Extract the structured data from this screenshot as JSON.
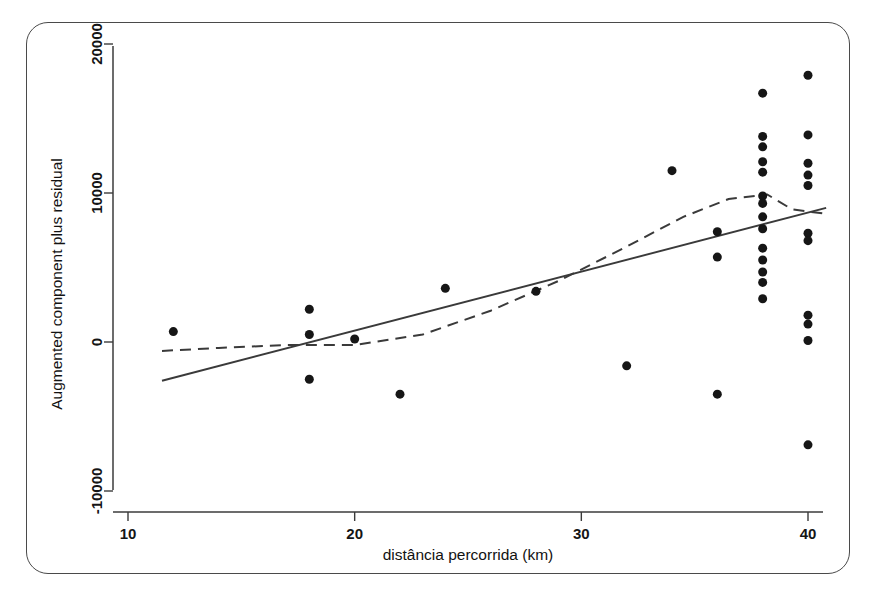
{
  "figure": {
    "frame_visible": true,
    "background_color": "#ffffff",
    "ink_color": "#161616"
  },
  "chart_data": {
    "type": "scatter",
    "title": "",
    "subtitle": "",
    "xlabel": "distância percorrida (km)",
    "ylabel": "Augmented component plus residual",
    "xlim": [
      10,
      41
    ],
    "ylim": [
      -11500,
      21000
    ],
    "xticks": [
      10,
      20,
      30,
      40
    ],
    "xtick_labels": [
      "10",
      "20",
      "30",
      "40"
    ],
    "yticks": [
      -10000,
      0,
      10000,
      20000
    ],
    "ytick_labels": [
      "-10000",
      "0",
      "10000",
      "20000"
    ],
    "grid": false,
    "legend": null,
    "legend_position": "none",
    "marker": {
      "shape": "circle",
      "color": "#161616",
      "size_px": 9
    },
    "points": [
      {
        "x": 12,
        "y": 700
      },
      {
        "x": 18,
        "y": 2200
      },
      {
        "x": 18,
        "y": 500
      },
      {
        "x": 18,
        "y": -2500
      },
      {
        "x": 20,
        "y": 200
      },
      {
        "x": 22,
        "y": -3500
      },
      {
        "x": 24,
        "y": 3600
      },
      {
        "x": 28,
        "y": 3400
      },
      {
        "x": 32,
        "y": -1600
      },
      {
        "x": 34,
        "y": 11500
      },
      {
        "x": 36,
        "y": 7400
      },
      {
        "x": 36,
        "y": 5700
      },
      {
        "x": 36,
        "y": -3500
      },
      {
        "x": 38,
        "y": 16700
      },
      {
        "x": 38,
        "y": 13800
      },
      {
        "x": 38,
        "y": 13100
      },
      {
        "x": 38,
        "y": 12100
      },
      {
        "x": 38,
        "y": 11400
      },
      {
        "x": 38,
        "y": 9800
      },
      {
        "x": 38,
        "y": 9300
      },
      {
        "x": 38,
        "y": 8400
      },
      {
        "x": 38,
        "y": 7600
      },
      {
        "x": 38,
        "y": 6300
      },
      {
        "x": 38,
        "y": 5500
      },
      {
        "x": 38,
        "y": 4700
      },
      {
        "x": 38,
        "y": 4000
      },
      {
        "x": 38,
        "y": 2900
      },
      {
        "x": 40,
        "y": 17900
      },
      {
        "x": 40,
        "y": 13900
      },
      {
        "x": 40,
        "y": 12000
      },
      {
        "x": 40,
        "y": 11200
      },
      {
        "x": 40,
        "y": 10500
      },
      {
        "x": 40,
        "y": 7300
      },
      {
        "x": 40,
        "y": 6800
      },
      {
        "x": 40,
        "y": 1800
      },
      {
        "x": 40,
        "y": 1200
      },
      {
        "x": 40,
        "y": 100
      },
      {
        "x": 40,
        "y": -6900
      }
    ],
    "series": [
      {
        "name": "linear fit",
        "style": "solid",
        "color": "#3a3a3a",
        "x": [
          11.5,
          40.8
        ],
        "y": [
          -2600,
          9000
        ]
      },
      {
        "name": "lowess smooth",
        "style": "dashed",
        "color": "#3a3a3a",
        "x": [
          11.5,
          14,
          17,
          20,
          23,
          26,
          29,
          32,
          34.5,
          36.5,
          38.2,
          39.3,
          40.8
        ],
        "y": [
          -600,
          -400,
          -200,
          -200,
          500,
          2100,
          4100,
          6400,
          8400,
          9600,
          9900,
          8900,
          8600
        ]
      }
    ]
  }
}
